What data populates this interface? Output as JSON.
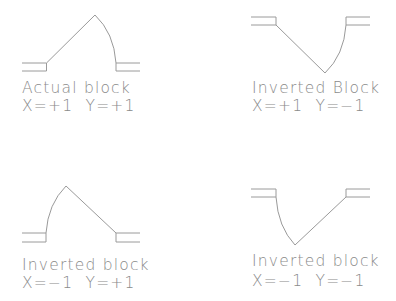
{
  "diagram": {
    "title": "",
    "line_color": "#9a9a9a",
    "text_color": "#8a8a8a",
    "blocks": [
      {
        "id": "actual",
        "name": "Actual block",
        "scale": "X=+1  Y=+1",
        "x_scale": "+1",
        "y_scale": "+1",
        "orientation": "upright, arc on right"
      },
      {
        "id": "inverted-y",
        "name": "Inverted Block",
        "scale": "X=+1  Y=−1",
        "x_scale": "+1",
        "y_scale": "-1",
        "orientation": "flipped vertically, arc on right"
      },
      {
        "id": "inverted-x",
        "name": "Inverted block",
        "scale": "X=−1  Y=+1",
        "x_scale": "-1",
        "y_scale": "+1",
        "orientation": "flipped horizontally, arc on left"
      },
      {
        "id": "inverted-xy",
        "name": "Inverted block",
        "scale": "X=−1  Y=−1",
        "x_scale": "-1",
        "y_scale": "-1",
        "orientation": "flipped both axes, arc on left"
      }
    ]
  }
}
